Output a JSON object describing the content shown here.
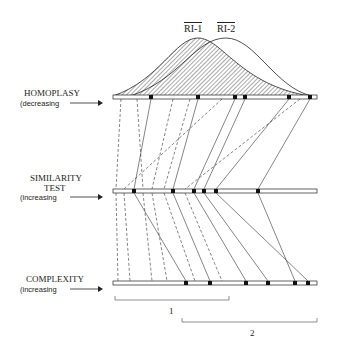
{
  "labels": {
    "ri1": "RI-1",
    "ri2": "RI-2",
    "homoplasy": "HOMOPLASY",
    "homoplasy_sub": "(decreasing",
    "similarity_1": "SIMILARITY",
    "similarity_2": "TEST",
    "similarity_sub": "(increasing",
    "complexity": "COMPLEXITY",
    "complexity_sub": "(increasing",
    "range1": "1",
    "range2": "2"
  },
  "colors": {
    "ink": "#222222",
    "hatch": "#555555"
  },
  "bars": {
    "homoplasy": {
      "y": 97,
      "hatched_x": [
        121,
        137,
        173,
        190,
        222,
        249
      ],
      "solid_x": [
        151,
        198,
        235,
        245,
        289,
        310
      ]
    },
    "similarity": {
      "y": 191,
      "hatched_x": [
        116,
        124,
        143,
        152,
        164
      ],
      "solid_x": [
        134,
        173,
        194,
        204,
        216,
        258
      ]
    },
    "complexity": {
      "y": 283,
      "hatched_x": [
        118,
        130,
        152,
        167,
        195,
        222
      ],
      "solid_x": [
        186,
        210,
        246,
        268,
        295,
        308
      ]
    }
  }
}
